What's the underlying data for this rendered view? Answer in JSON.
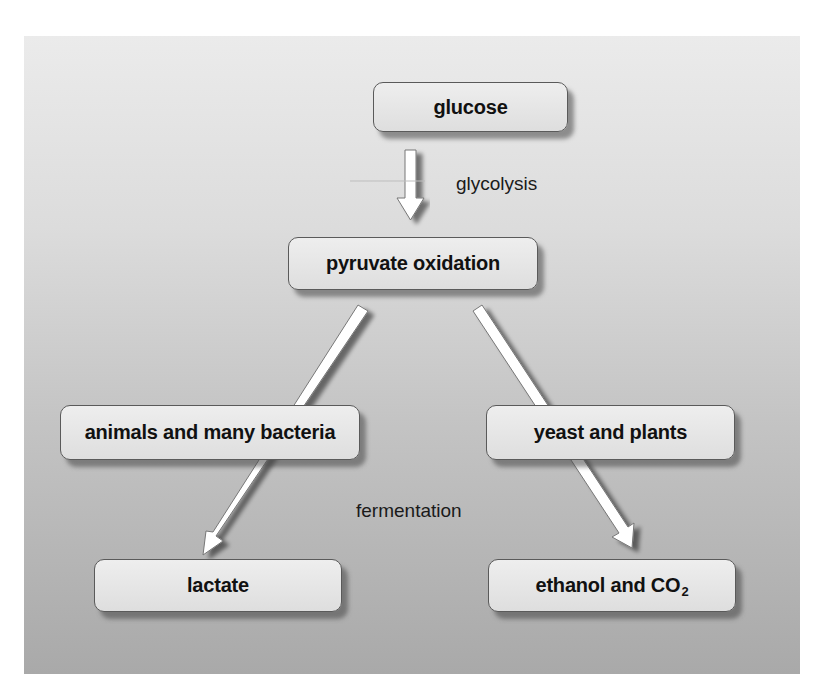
{
  "diagram": {
    "type": "flowchart",
    "colors": {
      "panel_top": "#ebebeb",
      "panel_bottom": "#a9a9a9",
      "node_fill": "#e6e6e6",
      "node_border": "#5a5a5a",
      "arrow_fill": "#ffffff",
      "text": "#111111"
    },
    "nodes": {
      "glucose": "glucose",
      "pyruvate": "pyruvate oxidation",
      "animals": "animals and many bacteria",
      "yeast": "yeast and plants",
      "lactate": "lactate",
      "ethanol_main": "ethanol and CO",
      "ethanol_sub": "2"
    },
    "labels": {
      "glycolysis": "glycolysis",
      "fermentation": "fermentation"
    },
    "edges": [
      {
        "from": "glucose",
        "to": "pyruvate oxidation",
        "label": "glycolysis"
      },
      {
        "from": "pyruvate oxidation",
        "to": "lactate",
        "via": "animals and many bacteria",
        "label": "fermentation"
      },
      {
        "from": "pyruvate oxidation",
        "to": "ethanol and CO2",
        "via": "yeast and plants",
        "label": "fermentation"
      }
    ]
  }
}
